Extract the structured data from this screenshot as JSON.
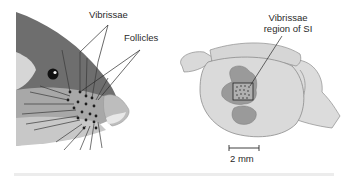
{
  "figure": {
    "left_panel": {
      "title": "Mouse snout with whiskers",
      "labels": {
        "vibrissae": "Vibrissae",
        "follicles": "Follicles"
      }
    },
    "right_panel": {
      "title": "Mouse brain, lateral view",
      "labels": {
        "region_line1": "Vibrissae",
        "region_line2": "region of SI"
      },
      "scale_bar": {
        "label": "2 mm"
      }
    },
    "colors": {
      "head_dark": "#6e6e6e",
      "head_mid": "#8a8a8a",
      "cheek_light": "#cfcfcf",
      "nose": "#bdbdbd",
      "brain_fill": "#d9d9d9",
      "brain_stroke": "#8c8c8c",
      "cortex_area": "#9a9a9a",
      "line": "#2a2a2a"
    }
  }
}
